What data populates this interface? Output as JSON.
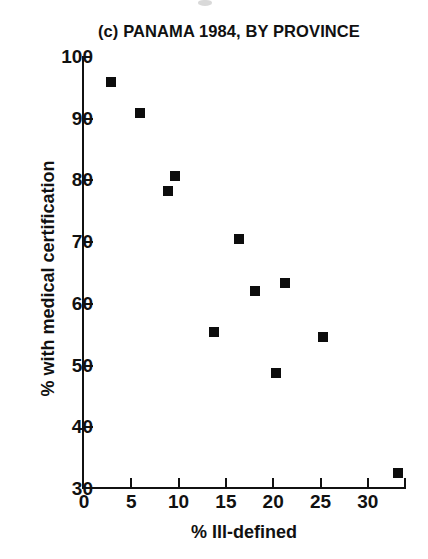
{
  "chart_data": {
    "type": "scatter",
    "title": "(c) PANAMA 1984, BY PROVINCE",
    "xlabel": "% Ill-defined",
    "ylabel": "% with medical certification",
    "xlim": [
      0,
      34
    ],
    "ylim": [
      30,
      100
    ],
    "xticks": [
      0,
      5,
      10,
      15,
      20,
      25,
      30
    ],
    "yticks": [
      30,
      40,
      50,
      60,
      70,
      80,
      90,
      100
    ],
    "xtick_labels": [
      "0",
      "5",
      "10",
      "15",
      "20",
      "25",
      "30"
    ],
    "ytick_labels": [
      "30",
      "40",
      "50",
      "60",
      "70",
      "80",
      "90",
      "100"
    ],
    "grid": false,
    "legend": false,
    "marker": "square",
    "marker_color": "#0d0d0d",
    "points": [
      {
        "x": 2.9,
        "y": 95.8
      },
      {
        "x": 5.9,
        "y": 90.8
      },
      {
        "x": 8.9,
        "y": 78.2
      },
      {
        "x": 9.6,
        "y": 80.5
      },
      {
        "x": 13.7,
        "y": 55.2
      },
      {
        "x": 16.4,
        "y": 70.3
      },
      {
        "x": 18.1,
        "y": 61.9
      },
      {
        "x": 20.3,
        "y": 48.6
      },
      {
        "x": 21.2,
        "y": 63.2
      },
      {
        "x": 25.3,
        "y": 54.4
      },
      {
        "x": 33.2,
        "y": 32.5
      }
    ]
  },
  "figure": {
    "title": "(c) PANAMA 1984, BY PROVINCE",
    "x_axis_label": "% Ill-defined",
    "y_axis_label": "% with medical certification"
  }
}
